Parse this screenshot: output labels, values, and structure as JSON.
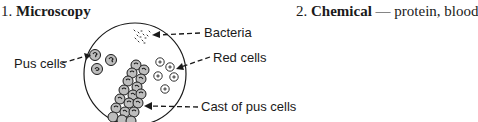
{
  "sections": [
    {
      "number": "1.",
      "title": "Microscopy",
      "suffix": ""
    },
    {
      "number": "2.",
      "title": "Chemical",
      "suffix": " — protein, blood"
    }
  ],
  "diagram": {
    "labels": {
      "bacteria": "Bacteria",
      "red_cells": "Red cells",
      "pus_cells": "Pus cells",
      "cast": "Cast of pus cells"
    },
    "colors": {
      "ink": "#1a1a1a",
      "background": "#ffffff",
      "cell_fill": "#bdbdbd"
    }
  }
}
